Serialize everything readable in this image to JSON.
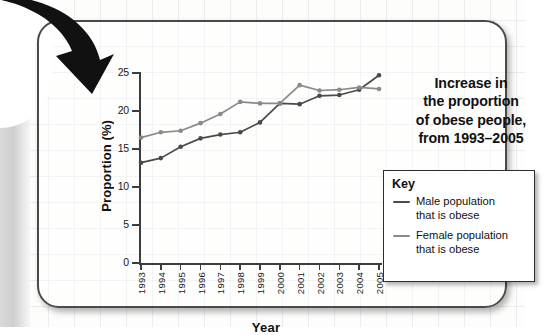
{
  "chart_data": {
    "type": "line",
    "title_lines": [
      "Increase in",
      "the proportion",
      "of obese people,",
      "from 1993–2005"
    ],
    "xlabel": "Year",
    "ylabel": "Proportion (%)",
    "x": [
      1993,
      1994,
      1995,
      1996,
      1997,
      1998,
      1999,
      2000,
      2001,
      2002,
      2003,
      2004,
      2005
    ],
    "categories": [
      "1993",
      "1994",
      "1995",
      "1996",
      "1997",
      "1998",
      "1999",
      "2000",
      "2001",
      "2002",
      "2003",
      "2004",
      "2005"
    ],
    "ylim": [
      0,
      25
    ],
    "yticks": [
      0,
      5,
      10,
      15,
      20,
      25
    ],
    "ytick_labels": [
      "0",
      "5",
      "10",
      "15",
      "20",
      "25"
    ],
    "grid": false,
    "legend_position": "right",
    "series": [
      {
        "name": "Male population that is obese",
        "color": "#4a4a4a",
        "values": [
          13.2,
          13.8,
          15.3,
          16.4,
          16.9,
          17.2,
          18.5,
          21.0,
          20.9,
          22.0,
          22.1,
          22.8,
          24.7
        ]
      },
      {
        "name": "Female population that is obese",
        "color": "#8a8a8a",
        "values": [
          16.5,
          17.2,
          17.4,
          18.4,
          19.6,
          21.2,
          21.0,
          21.0,
          23.4,
          22.7,
          22.8,
          23.1,
          22.9
        ]
      }
    ]
  },
  "legend": {
    "title": "Key",
    "entries": [
      {
        "label_line1": "Male population",
        "label_line2": "that is obese",
        "color": "#4a4a4a"
      },
      {
        "label_line1": "Female population",
        "label_line2": "that is obese",
        "color": "#8a8a8a"
      }
    ]
  },
  "decoration": {
    "arrow_name": "curved-down-arrow",
    "arrow_color": "#111111"
  },
  "colors": {
    "card_border": "#4a4a4a",
    "male_line": "#4a4a4a",
    "female_line": "#8a8a8a",
    "axis": "#3d3d3d"
  }
}
